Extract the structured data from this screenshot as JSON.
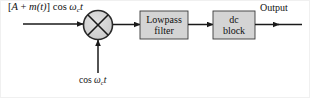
{
  "figure": {
    "width": 310,
    "height": 98,
    "background": "#ffffff",
    "line_color": "#1a1a1a",
    "block_fill": "#d4d4d4",
    "block_stroke": "#3a3a3a",
    "border_color": "#f0f0f0"
  },
  "labels": {
    "input_signal": "[A + m(t)] cos ωct",
    "input_signal_parts": {
      "bracket_open": "[",
      "amplitude": "A",
      "plus": "+",
      "message": "m(t)",
      "bracket_close": "]",
      "cos": "cos",
      "omega": "ω",
      "subscript": "c",
      "time": "t"
    },
    "carrier_signal": "cos ωct",
    "carrier_signal_parts": {
      "cos": "cos",
      "omega": "ω",
      "subscript": "c",
      "time": "t"
    },
    "output": "Output"
  },
  "blocks": [
    {
      "id": "multiplier",
      "type": "circle-multiplier",
      "symbol": "⊗",
      "label": "",
      "cx": 97,
      "cy": 24,
      "r": 14.5
    },
    {
      "id": "lowpass-filter",
      "type": "rect",
      "line1": "Lowpass",
      "line2": "filter",
      "x": 139,
      "y": 10,
      "w": 48,
      "h": 28
    },
    {
      "id": "dc-block",
      "type": "rect",
      "line1": "dc",
      "line2": "block",
      "x": 212,
      "y": 10,
      "w": 42,
      "h": 28
    }
  ],
  "connections": [
    {
      "id": "input-to-multiplier",
      "from": "input",
      "to": "multiplier",
      "orientation": "horizontal",
      "arrow": true
    },
    {
      "id": "carrier-to-multiplier",
      "from": "carrier",
      "to": "multiplier",
      "orientation": "vertical",
      "arrow": true
    },
    {
      "id": "multiplier-to-lpf",
      "from": "multiplier",
      "to": "lowpass-filter",
      "orientation": "horizontal",
      "arrow": true
    },
    {
      "id": "lpf-to-dcblock",
      "from": "lowpass-filter",
      "to": "dc-block",
      "orientation": "horizontal",
      "arrow": true
    },
    {
      "id": "dcblock-to-output",
      "from": "dc-block",
      "to": "output",
      "orientation": "horizontal",
      "arrow": true
    }
  ]
}
